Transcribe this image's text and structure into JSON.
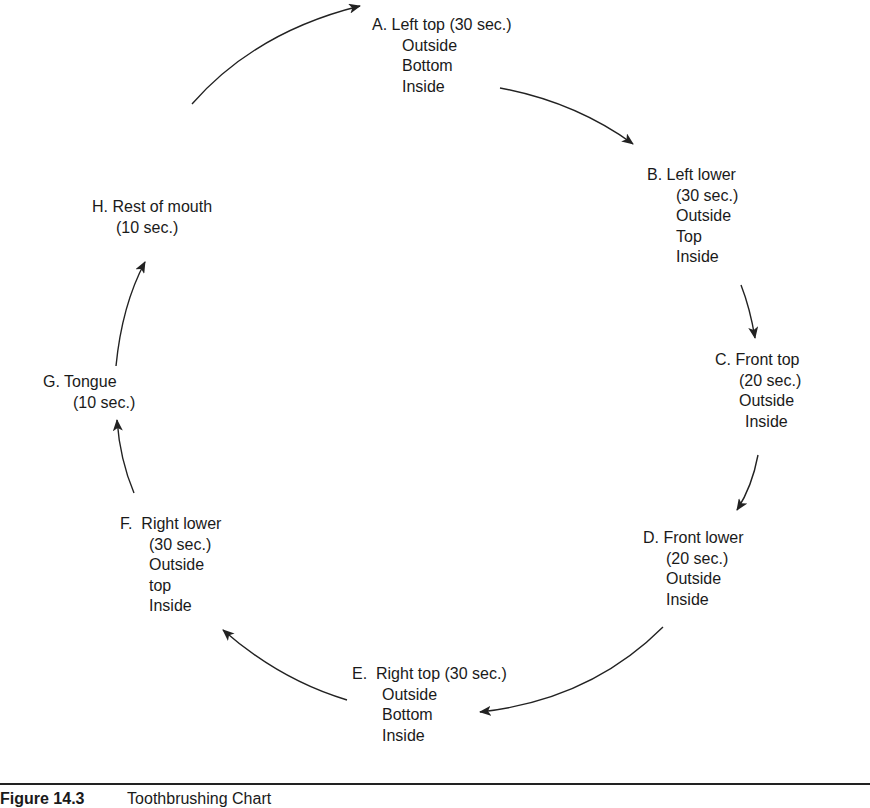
{
  "diagram": {
    "type": "cycle",
    "title": "Toothbrushing Chart",
    "nodes": [
      {
        "id": "A",
        "lines": [
          "A. Left top (30 sec.)",
          "Outside",
          "Bottom",
          "Inside"
        ]
      },
      {
        "id": "B",
        "lines": [
          "B. Left lower",
          "(30 sec.)",
          "Outside",
          "Top",
          "Inside"
        ]
      },
      {
        "id": "C",
        "lines": [
          "C. Front top",
          "(20 sec.)",
          "Outside",
          "Inside"
        ]
      },
      {
        "id": "D",
        "lines": [
          "D. Front lower",
          "(20 sec.)",
          "Outside",
          "Inside"
        ]
      },
      {
        "id": "E",
        "lines": [
          "E.  Right top (30 sec.)",
          "Outside",
          "Bottom",
          "Inside"
        ]
      },
      {
        "id": "F",
        "lines": [
          "F.  Right lower",
          "(30 sec.)",
          "Outside",
          "top",
          "Inside"
        ]
      },
      {
        "id": "G",
        "lines": [
          "G. Tongue",
          "(10 sec.)"
        ]
      },
      {
        "id": "H",
        "lines": [
          "H. Rest of mouth",
          "(10 sec.)"
        ]
      }
    ],
    "edges": [
      {
        "from": "A",
        "to": "B"
      },
      {
        "from": "B",
        "to": "C"
      },
      {
        "from": "C",
        "to": "D"
      },
      {
        "from": "D",
        "to": "E"
      },
      {
        "from": "E",
        "to": "F"
      },
      {
        "from": "F",
        "to": "G"
      },
      {
        "from": "G",
        "to": "H"
      },
      {
        "from": "H",
        "to": "A"
      }
    ]
  },
  "caption": {
    "figure_label": "Figure 14.3",
    "text": "Toothbrushing Chart"
  },
  "colors": {
    "line": "#222222",
    "text": "#1a1a1a",
    "background": "#ffffff"
  }
}
